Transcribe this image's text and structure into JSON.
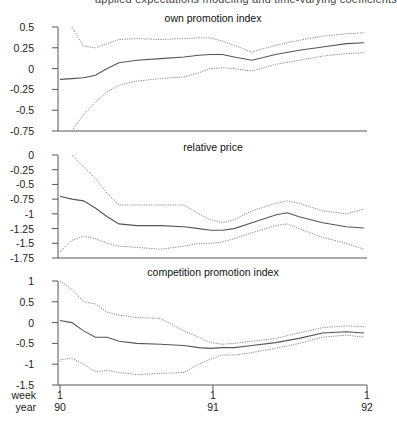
{
  "header": {
    "cutoff_text": "applied expectations modeling and time-varying coefficients"
  },
  "chart_data": [
    {
      "type": "line",
      "title": "own promotion index",
      "xlabel": "",
      "ylabel": "",
      "ylim": [
        -0.75,
        0.5
      ],
      "yticks": [
        "0.5",
        "0.25",
        "0",
        "-0.25",
        "-0.5",
        "-0.75"
      ],
      "x": [
        1,
        5,
        9,
        13,
        17,
        21,
        27,
        35,
        43,
        48,
        52,
        56,
        60,
        66,
        74,
        82,
        90,
        98,
        104
      ],
      "series": [
        {
          "name": "estimate",
          "style": "solid",
          "values": [
            -0.13,
            -0.12,
            -0.11,
            -0.08,
            0.0,
            0.07,
            0.1,
            0.12,
            0.14,
            0.16,
            0.17,
            0.17,
            0.14,
            0.1,
            0.17,
            0.22,
            0.26,
            0.3,
            0.31
          ]
        },
        {
          "name": "upper band",
          "style": "dotted",
          "values": [
            null,
            0.5,
            0.27,
            0.25,
            0.3,
            0.35,
            0.36,
            0.35,
            0.36,
            0.37,
            0.37,
            0.33,
            0.28,
            0.2,
            0.28,
            0.34,
            0.39,
            0.42,
            0.43
          ]
        },
        {
          "name": "lower band",
          "style": "dotted",
          "values": [
            null,
            -0.75,
            -0.55,
            -0.4,
            -0.28,
            -0.2,
            -0.15,
            -0.12,
            -0.1,
            -0.05,
            0.0,
            0.01,
            0.0,
            -0.03,
            0.05,
            0.1,
            0.15,
            0.18,
            0.19
          ]
        }
      ]
    },
    {
      "type": "line",
      "title": "relative price",
      "xlabel": "",
      "ylabel": "",
      "ylim": [
        -1.75,
        0
      ],
      "yticks": [
        "0",
        "-0.25",
        "-0.5",
        "-0.75",
        "-1",
        "-1.25",
        "-1.5",
        "-1.75"
      ],
      "x": [
        1,
        5,
        9,
        13,
        17,
        21,
        27,
        35,
        43,
        48,
        52,
        56,
        60,
        66,
        74,
        78,
        82,
        90,
        98,
        104
      ],
      "series": [
        {
          "name": "estimate",
          "style": "solid",
          "values": [
            -0.7,
            -0.75,
            -0.78,
            -0.9,
            -1.05,
            -1.17,
            -1.2,
            -1.2,
            -1.22,
            -1.25,
            -1.28,
            -1.28,
            -1.25,
            -1.15,
            -1.02,
            -0.98,
            -1.05,
            -1.15,
            -1.22,
            -1.24
          ]
        },
        {
          "name": "upper band",
          "style": "dotted",
          "values": [
            null,
            0.0,
            -0.2,
            -0.4,
            -0.65,
            -0.85,
            -0.85,
            -0.85,
            -0.85,
            -1.0,
            -1.1,
            -1.15,
            -1.1,
            -0.95,
            -0.82,
            -0.78,
            -0.82,
            -0.95,
            -1.0,
            -0.92
          ]
        },
        {
          "name": "lower band",
          "style": "dotted",
          "values": [
            -1.65,
            -1.45,
            -1.38,
            -1.42,
            -1.5,
            -1.55,
            -1.57,
            -1.6,
            -1.55,
            -1.5,
            -1.5,
            -1.48,
            -1.42,
            -1.32,
            -1.2,
            -1.17,
            -1.25,
            -1.4,
            -1.5,
            -1.6
          ]
        }
      ]
    },
    {
      "type": "line",
      "title": "competition promotion index",
      "xlabel": "week / year",
      "ylabel": "",
      "ylim": [
        -1.5,
        1
      ],
      "yticks": [
        "1",
        "0.5",
        "0",
        "-0.5",
        "-1",
        "-1.5"
      ],
      "x": [
        1,
        5,
        9,
        13,
        17,
        21,
        27,
        35,
        43,
        48,
        52,
        56,
        60,
        66,
        74,
        82,
        90,
        98,
        104
      ],
      "series": [
        {
          "name": "estimate",
          "style": "solid",
          "values": [
            0.05,
            0.0,
            -0.2,
            -0.35,
            -0.35,
            -0.45,
            -0.5,
            -0.52,
            -0.55,
            -0.6,
            -0.62,
            -0.6,
            -0.6,
            -0.55,
            -0.48,
            -0.38,
            -0.25,
            -0.22,
            -0.25
          ]
        },
        {
          "name": "upper band",
          "style": "dotted",
          "values": [
            1.0,
            0.8,
            0.5,
            0.45,
            0.25,
            0.18,
            0.12,
            0.1,
            -0.2,
            -0.35,
            -0.48,
            -0.52,
            -0.5,
            -0.45,
            -0.38,
            -0.25,
            -0.12,
            -0.08,
            -0.1
          ]
        },
        {
          "name": "lower band",
          "style": "dotted",
          "values": [
            -0.9,
            -0.85,
            -1.0,
            -1.18,
            -1.15,
            -1.2,
            -1.25,
            -1.22,
            -1.2,
            -1.0,
            -0.88,
            -0.78,
            -0.78,
            -0.72,
            -0.62,
            -0.5,
            -0.35,
            -0.3,
            -0.35
          ]
        }
      ]
    }
  ],
  "x_axis": {
    "row_labels": [
      "week",
      "year"
    ],
    "ticks": [
      {
        "week": "1",
        "year": "90"
      },
      {
        "week": "1",
        "year": "91"
      },
      {
        "week": "1",
        "year": "92"
      }
    ]
  }
}
